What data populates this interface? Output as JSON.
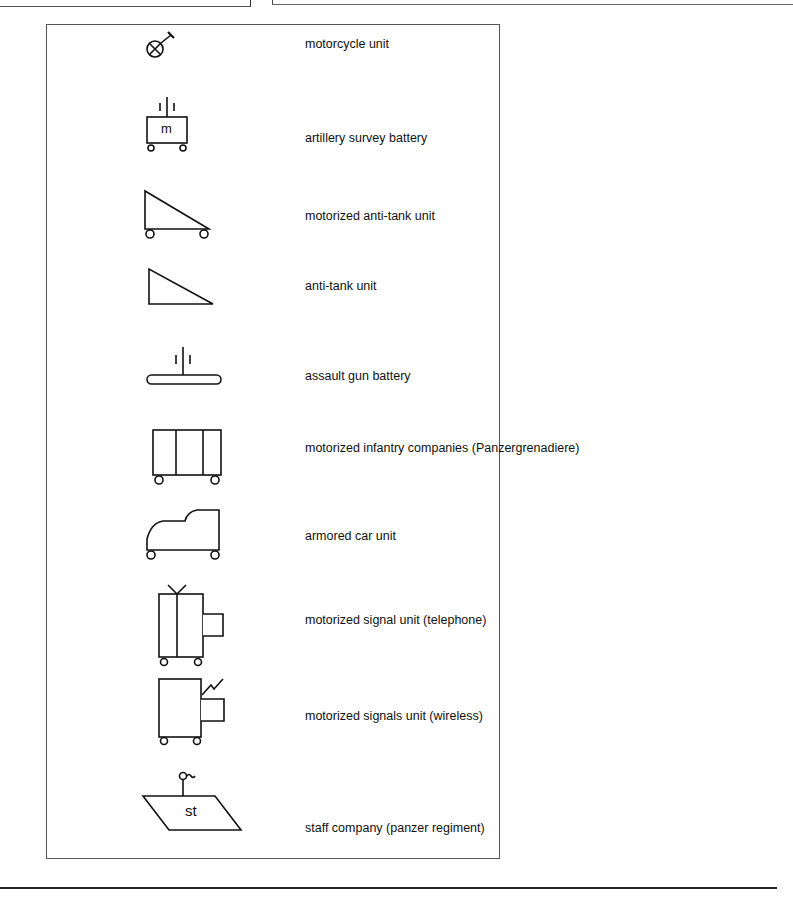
{
  "legend": {
    "items": [
      {
        "symbol": "motorcycle-icon",
        "label": "motorcycle unit"
      },
      {
        "symbol": "artillery-survey-icon",
        "label": "artillery survey battery",
        "symbol_text": "m"
      },
      {
        "symbol": "motorized-anti-tank-icon",
        "label": "motorized anti-tank unit"
      },
      {
        "symbol": "anti-tank-icon",
        "label": "anti-tank unit"
      },
      {
        "symbol": "assault-gun-icon",
        "label": "assault gun battery"
      },
      {
        "symbol": "motorized-infantry-icon",
        "label": "motorized infantry companies (Panzergrenadiere)"
      },
      {
        "symbol": "armored-car-icon",
        "label": "armored car unit"
      },
      {
        "symbol": "signal-telephone-icon",
        "label": "motorized signal unit (telephone)"
      },
      {
        "symbol": "signal-wireless-icon",
        "label": "motorized signals unit (wireless)"
      },
      {
        "symbol": "staff-company-icon",
        "label": "staff company (panzer regiment)",
        "symbol_text": "st"
      }
    ]
  }
}
